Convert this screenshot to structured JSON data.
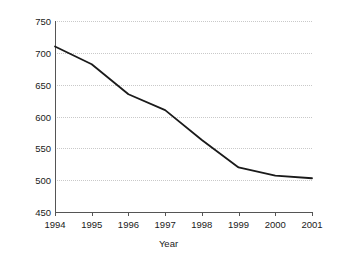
{
  "chart_data": {
    "type": "line",
    "title": "",
    "xlabel": "Year",
    "ylabel": "Victims per 1,000 Population",
    "categories": [
      "1994",
      "1995",
      "1996",
      "1997",
      "1998",
      "1999",
      "2000",
      "2001"
    ],
    "x": [
      1994,
      1995,
      1996,
      1997,
      1998,
      1999,
      2000,
      2001
    ],
    "values": [
      710,
      682,
      635,
      610,
      563,
      520,
      507,
      503
    ],
    "series": [
      {
        "name": "Victims per 1,000 Population",
        "values": [
          710,
          682,
          635,
          610,
          563,
          520,
          507,
          503
        ]
      }
    ],
    "ylim": [
      450,
      750
    ],
    "yticks": [
      450,
      500,
      550,
      600,
      650,
      700,
      750
    ],
    "ytick_labels": [
      "450",
      "500",
      "550",
      "600",
      "650",
      "700",
      "750"
    ],
    "xlim": [
      1994,
      2001
    ],
    "grid": "horizontal-dotted",
    "legend": "none",
    "line_color": "#1a1a1a",
    "grid_color": "#c9c9c9",
    "axis_color": "#555555",
    "background_color": "#ffffff",
    "annotations": []
  }
}
